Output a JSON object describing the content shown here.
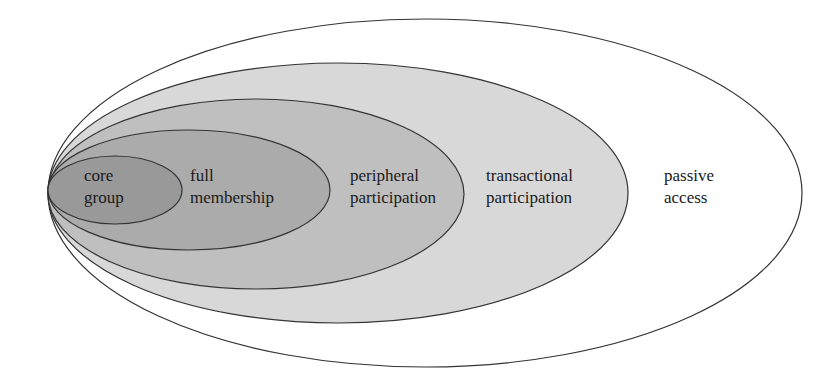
{
  "diagram": {
    "type": "nested-ellipses",
    "layers": [
      {
        "id": "passive",
        "line1": "passive",
        "line2": "access",
        "fill": "#ffffff"
      },
      {
        "id": "transactional",
        "line1": "transactional",
        "line2": "participation",
        "fill": "#d8d8d8"
      },
      {
        "id": "peripheral",
        "line1": "peripheral",
        "line2": "participation",
        "fill": "#bfbfbf"
      },
      {
        "id": "full",
        "line1": "full",
        "line2": "membership",
        "fill": "#ababab"
      },
      {
        "id": "core",
        "line1": "core",
        "line2": "group",
        "fill": "#999999"
      }
    ],
    "stroke": "#333333"
  }
}
